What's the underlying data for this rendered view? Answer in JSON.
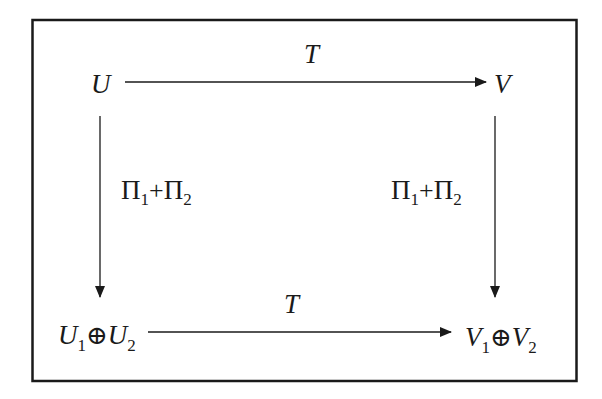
{
  "diagram": {
    "type": "commutative-diagram",
    "nodes": {
      "top_left": {
        "main": "U"
      },
      "top_right": {
        "main": "V"
      },
      "bottom_left": {
        "a": "U",
        "a_sub": "1",
        "op": "⊕",
        "b": "U",
        "b_sub": "2"
      },
      "bottom_right": {
        "a": "V",
        "a_sub": "1",
        "op": "⊕",
        "b": "V",
        "b_sub": "2"
      }
    },
    "arrows": {
      "top": {
        "from": "U",
        "to": "V",
        "label": "T"
      },
      "bottom": {
        "from": "U1⊕U2",
        "to": "V1⊕V2",
        "label": "T"
      },
      "left": {
        "from": "U",
        "to": "U1⊕U2",
        "label": {
          "a": "Π",
          "a_sub": "1",
          "op": "+",
          "b": "Π",
          "b_sub": "2"
        }
      },
      "right": {
        "from": "V",
        "to": "V1⊕V2",
        "label": {
          "a": "Π",
          "a_sub": "1",
          "op": "+",
          "b": "Π",
          "b_sub": "2"
        }
      }
    },
    "colors": {
      "ink": "#1a1a1a",
      "background": "#ffffff"
    }
  }
}
